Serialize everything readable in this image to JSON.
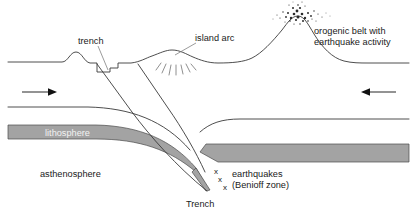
{
  "diagram": {
    "background_color": "#ffffff",
    "line_color": "#3a3a3a",
    "band_color": "#a3a3a3",
    "text_color": "#1a1a1a"
  },
  "labels": {
    "trench_upper": "trench",
    "island_arc": "island arc",
    "orogenic_line1": "orogenic belt with",
    "orogenic_line2": "earthquake activity",
    "lithosphere": "lithosphere",
    "asthenosphere": "asthenosphere",
    "earthquakes_line1": "earthquakes",
    "earthquakes_line2": "(Benioff zone)",
    "trench_bottom": "Trench",
    "x_mark_1": "x",
    "x_mark_2": "x",
    "x_mark_3": "x"
  },
  "arrows": {
    "left_direction": "right",
    "right_direction": "left"
  },
  "features": {
    "ash_plume": "ash-cloud",
    "radiating_lines_count": 7
  }
}
